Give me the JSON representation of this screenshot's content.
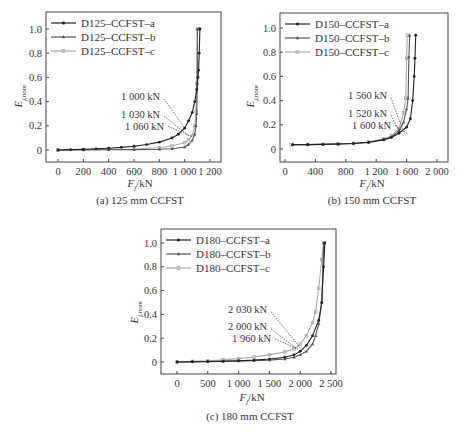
{
  "chart_data": [
    {
      "type": "line",
      "title": "(a) 125 mm CCFST",
      "xlabel": "F_j/kN",
      "ylabel": "E_j,nom",
      "xlim": [
        -100,
        1250
      ],
      "ylim": [
        -0.1,
        1.1
      ],
      "xticks": [
        0,
        200,
        400,
        600,
        800,
        1000,
        1200
      ],
      "xtick_labels": [
        "0",
        "200",
        "400",
        "600",
        "800",
        "1 000",
        "1 200"
      ],
      "yticks": [
        0,
        0.2,
        0.4,
        0.6,
        0.8,
        1.0
      ],
      "ytick_labels": [
        "0",
        "0.2",
        "0.4",
        "0.6",
        "0.8",
        "1.0"
      ],
      "grid": false,
      "legend_position": "upper left",
      "series": [
        {
          "name": "D125–CCFST–a",
          "color": "#222222",
          "marker": "circle",
          "x": [
            0,
            100,
            200,
            300,
            400,
            500,
            600,
            700,
            800,
            900,
            950,
            1000,
            1030,
            1060,
            1080,
            1095,
            1105,
            1110,
            1115,
            1120,
            1120
          ],
          "y": [
            0.0,
            0.003,
            0.006,
            0.01,
            0.015,
            0.022,
            0.031,
            0.045,
            0.065,
            0.1,
            0.13,
            0.18,
            0.24,
            0.31,
            0.4,
            0.5,
            0.6,
            0.66,
            0.8,
            1.0,
            1.0
          ]
        },
        {
          "name": "D125–CCFST–b",
          "color": "#555555",
          "marker": "triangle",
          "x": [
            0,
            200,
            400,
            600,
            800,
            900,
            1000,
            1030,
            1060,
            1080,
            1090,
            1095,
            1100,
            1100
          ],
          "y": [
            0.0,
            0.001,
            0.002,
            0.003,
            0.006,
            0.01,
            0.025,
            0.045,
            0.08,
            0.13,
            0.2,
            0.3,
            0.55,
            1.0
          ]
        },
        {
          "name": "D125–CCFST–c",
          "color": "#aaaaaa",
          "marker": "square",
          "x": [
            0,
            200,
            400,
            600,
            800,
            900,
            1000,
            1030,
            1060,
            1080,
            1090,
            1095,
            1100
          ],
          "y": [
            0.0,
            0.002,
            0.004,
            0.008,
            0.018,
            0.035,
            0.06,
            0.085,
            0.12,
            0.2,
            0.32,
            0.55,
            1.0
          ]
        }
      ],
      "annotations": [
        {
          "text": "1 000 kN",
          "x": 1000,
          "y": 0.18
        },
        {
          "text": "1 030 kN",
          "x": 1030,
          "y": 0.12
        },
        {
          "text": "1 060 kN",
          "x": 1060,
          "y": 0.11
        }
      ]
    },
    {
      "type": "line",
      "title": "(b) 150 mm CCFST",
      "xlabel": "F_j/kN",
      "ylabel": "E_j,nom",
      "xlim": [
        -80,
        2100
      ],
      "ylim": [
        -0.1,
        1.1
      ],
      "xticks": [
        0,
        400,
        800,
        1200,
        1600,
        2000
      ],
      "xtick_labels": [
        "0",
        "400",
        "800",
        "1 200",
        "1 600",
        "2 000"
      ],
      "yticks": [
        0,
        0.2,
        0.4,
        0.6,
        0.8,
        1.0
      ],
      "ytick_labels": [
        "0",
        "0.2",
        "0.4",
        "0.6",
        "0.8",
        "1.0"
      ],
      "grid": false,
      "legend_position": "upper left",
      "series": [
        {
          "name": "D150–CCFST–a",
          "color": "#222222",
          "marker": "circle",
          "x": [
            100,
            300,
            500,
            700,
            900,
            1100,
            1300,
            1400,
            1500,
            1600,
            1650,
            1680,
            1700,
            1710,
            1720
          ],
          "y": [
            0.035,
            0.036,
            0.038,
            0.041,
            0.046,
            0.055,
            0.075,
            0.095,
            0.13,
            0.18,
            0.25,
            0.4,
            0.6,
            0.75,
            0.94
          ]
        },
        {
          "name": "D150–CCFST–b",
          "color": "#555555",
          "marker": "triangle",
          "x": [
            100,
            300,
            500,
            700,
            900,
            1100,
            1300,
            1400,
            1500,
            1560,
            1600,
            1620,
            1630,
            1640
          ],
          "y": [
            0.035,
            0.036,
            0.038,
            0.041,
            0.046,
            0.056,
            0.08,
            0.1,
            0.15,
            0.22,
            0.33,
            0.42,
            0.76,
            0.94
          ]
        },
        {
          "name": "D150–CCFST–c",
          "color": "#aaaaaa",
          "marker": "square",
          "x": [
            80,
            300,
            500,
            700,
            900,
            1100,
            1300,
            1400,
            1500,
            1560,
            1590,
            1600,
            1610
          ],
          "y": [
            0.036,
            0.037,
            0.039,
            0.042,
            0.047,
            0.058,
            0.085,
            0.11,
            0.17,
            0.3,
            0.42,
            0.75,
            0.94
          ]
        }
      ],
      "annotations": [
        {
          "text": "1 560 kN",
          "x": 1560,
          "y": 0.14
        },
        {
          "text": "1 520 kN",
          "x": 1520,
          "y": 0.13
        },
        {
          "text": "1 600 kN",
          "x": 1600,
          "y": 0.13
        }
      ]
    },
    {
      "type": "line",
      "title": "(c) 180 mm CCFST",
      "xlabel": "F_j/kN",
      "ylabel": "E_j,nom",
      "xlim": [
        -150,
        2600
      ],
      "ylim": [
        -0.1,
        1.1
      ],
      "xticks": [
        0,
        500,
        1000,
        1500,
        2000,
        2500
      ],
      "xtick_labels": [
        "0",
        "500",
        "1 000",
        "1 500",
        "2 000",
        "2 500"
      ],
      "yticks": [
        0,
        0.2,
        0.4,
        0.6,
        0.8,
        1.0
      ],
      "ytick_labels": [
        "0",
        "0.2",
        "0.4",
        "0.6",
        "0.8",
        "1.0"
      ],
      "grid": false,
      "legend_position": "upper left",
      "series": [
        {
          "name": "D180–CCFST–a",
          "color": "#222222",
          "marker": "circle",
          "x": [
            0,
            250,
            500,
            750,
            1000,
            1250,
            1500,
            1750,
            1900,
            2000,
            2100,
            2200,
            2300,
            2350,
            2380,
            2400
          ],
          "y": [
            0.0,
            0.002,
            0.004,
            0.007,
            0.011,
            0.016,
            0.025,
            0.04,
            0.06,
            0.09,
            0.14,
            0.22,
            0.35,
            0.5,
            0.8,
            1.0
          ]
        },
        {
          "name": "D180–CCFST–b",
          "color": "#555555",
          "marker": "triangle",
          "x": [
            0,
            250,
            500,
            750,
            1000,
            1250,
            1500,
            1750,
            1900,
            2000,
            2100,
            2200,
            2250,
            2300,
            2350,
            2380
          ],
          "y": [
            0.0,
            0.001,
            0.002,
            0.004,
            0.007,
            0.011,
            0.016,
            0.025,
            0.04,
            0.06,
            0.09,
            0.15,
            0.22,
            0.32,
            0.5,
            1.0
          ]
        },
        {
          "name": "D180–CCFST–c",
          "color": "#aaaaaa",
          "marker": "square",
          "x": [
            0,
            250,
            500,
            750,
            1000,
            1250,
            1500,
            1750,
            1900,
            2000,
            2100,
            2200,
            2250,
            2300,
            2350,
            2380
          ],
          "y": [
            0.0,
            0.005,
            0.01,
            0.018,
            0.028,
            0.042,
            0.06,
            0.085,
            0.11,
            0.15,
            0.22,
            0.33,
            0.42,
            0.62,
            0.86,
            1.0
          ]
        }
      ],
      "annotations": [
        {
          "text": "2 030 kN",
          "x": 2030,
          "y": 0.1
        },
        {
          "text": "2 000 kN",
          "x": 2000,
          "y": 0.09
        },
        {
          "text": "1 960 kN",
          "x": 1960,
          "y": 0.11
        }
      ]
    }
  ],
  "panels": [
    {
      "caption": "(a) 125 mm CCFST",
      "xlabel_main": "F",
      "xlabel_sub": "j",
      "xlabel_unit": "/kN",
      "ylabel_main": "E",
      "ylabel_sub": "j,nom"
    },
    {
      "caption": "(b) 150 mm CCFST",
      "xlabel_main": "F",
      "xlabel_sub": "j",
      "xlabel_unit": "/kN",
      "ylabel_main": "E",
      "ylabel_sub": "j,nom"
    },
    {
      "caption": "(c) 180 mm CCFST",
      "xlabel_main": "F",
      "xlabel_sub": "j",
      "xlabel_unit": "/kN",
      "ylabel_main": "E",
      "ylabel_sub": "j,nom"
    }
  ]
}
